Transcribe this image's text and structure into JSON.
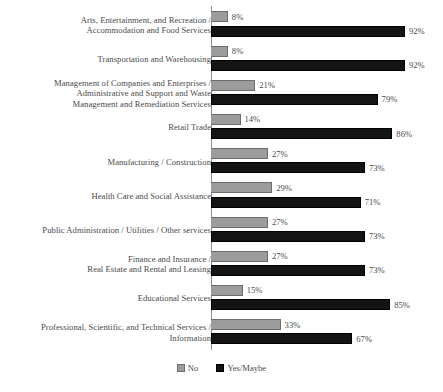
{
  "chart_data": {
    "type": "bar",
    "orientation": "horizontal",
    "title": "",
    "subtitle": "",
    "xlabel": "",
    "ylabel": "",
    "xlim": [
      0,
      100
    ],
    "grid": false,
    "legend_position": "bottom",
    "value_suffix": "%",
    "categories": [
      "Arts, Entertainment, and Recreation /\nAccommodation and Food Services",
      "Transportation and Warehousing",
      "Management of Companies and Enterprises /\nAdministrative and Support and Waste\nManagement and Remediation Services",
      "Retail Trade",
      "Manufacturing / Construction",
      "Health Care and Social Assistance",
      "Public Administration / Utilities / Other services",
      "Finance and Insurance /\nReal Estate and Rental and Leasing",
      "Educational Services",
      "Professional, Scientific, and Technical Services /\nInformation"
    ],
    "series": [
      {
        "name": "No",
        "color": "#9c9c9c",
        "values": [
          8,
          8,
          21,
          14,
          27,
          29,
          27,
          27,
          15,
          33
        ],
        "labels": [
          "8%",
          "8%",
          "21%",
          "14%",
          "27%",
          "29%",
          "27%",
          "27%",
          "15%",
          "33%"
        ]
      },
      {
        "name": "Yes/Maybe",
        "color": "#141414",
        "values": [
          92,
          92,
          79,
          86,
          73,
          71,
          73,
          73,
          85,
          67
        ],
        "labels": [
          "92%",
          "92%",
          "79%",
          "86%",
          "73%",
          "71%",
          "73%",
          "73%",
          "85%",
          "67%"
        ]
      }
    ]
  },
  "legend": {
    "items": [
      {
        "label": "No",
        "swatch": "legend-swatch-no"
      },
      {
        "label": "Yes/Maybe",
        "swatch": "legend-swatch-yes"
      }
    ]
  },
  "colors": {
    "no": "#9c9c9c",
    "yes": "#141414",
    "axis": "#8e8e8e",
    "text": "#4a4a4a",
    "background": "#ffffff"
  }
}
